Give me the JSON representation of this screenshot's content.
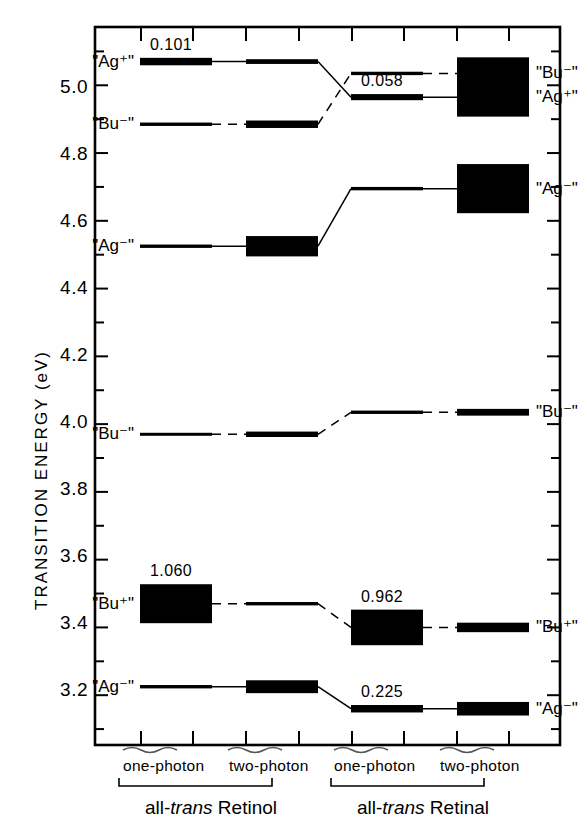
{
  "figure": {
    "y_axis_title": "TRANSITION ENERGY (eV)",
    "y_ticks_major": [
      "5.0",
      "4.8",
      "4.6",
      "4.4",
      "4.2",
      "4.0",
      "3.8",
      "3.6",
      "3.4",
      "3.2"
    ],
    "column_labels": [
      "one-photon",
      "two-photon",
      "one-photon",
      "two-photon"
    ],
    "group_labels": [
      "all-",
      "trans",
      " Retinol",
      "all-",
      "trans",
      " Retinal"
    ],
    "group_left": {
      "prefix": "all-",
      "italic": "trans",
      "suffix": " Retinol"
    },
    "group_right": {
      "prefix": "all-",
      "italic": "trans",
      "suffix": " Retinal"
    }
  },
  "chart_data": {
    "type": "line",
    "xlabel": "",
    "ylabel": "TRANSITION ENERGY (eV)",
    "ylim": [
      3.05,
      5.17
    ],
    "yticks": [
      3.2,
      3.4,
      3.6,
      3.8,
      4.0,
      4.2,
      4.4,
      4.6,
      4.8,
      5.0
    ],
    "grid": false,
    "legend": "none",
    "columns": [
      {
        "id": "retinol-one-photon",
        "label": "one-photon",
        "molecule": "all-trans Retinol"
      },
      {
        "id": "retinol-two-photon",
        "label": "two-photon",
        "molecule": "all-trans Retinol"
      },
      {
        "id": "retinal-one-photon",
        "label": "one-photon",
        "molecule": "all-trans Retinal"
      },
      {
        "id": "retinal-two-photon",
        "label": "two-photon",
        "molecule": "all-trans Retinal"
      }
    ],
    "levels": [
      {
        "state": "\"Ag+\"",
        "left_label": "\"Ag⁺\"",
        "right_label": null,
        "connector": "solid",
        "energies": [
          5.07,
          5.07,
          4.965,
          4.965
        ],
        "oscillator_strengths": [
          {
            "column": "retinol-one-photon",
            "value": "0.101"
          },
          {
            "column": "retinal-one-photon",
            "value": "0.058"
          }
        ],
        "box_heights_eV": [
          0.022,
          0.014,
          0.018,
          0.115
        ],
        "right_state": "\"Ag+\""
      },
      {
        "state": "\"Bu-\"",
        "left_label": "\"Bu⁻\"",
        "connector": "dashed",
        "energies": [
          4.885,
          4.885,
          5.035,
          5.035
        ],
        "oscillator_strengths": [],
        "box_heights_eV": [
          0.01,
          0.022,
          0.01,
          0.095
        ],
        "right_state": "\"Bu-\""
      },
      {
        "state": "\"Ag-\"",
        "left_label": "\"Ag⁻\"",
        "connector": "solid",
        "energies": [
          4.525,
          4.525,
          4.695,
          4.695
        ],
        "oscillator_strengths": [],
        "box_heights_eV": [
          0.01,
          0.06,
          0.01,
          0.145
        ],
        "right_state": "\"Ag-\""
      },
      {
        "state": "\"Bu-\"",
        "left_label": "\"Bu⁻\"",
        "connector": "dashed",
        "energies": [
          3.97,
          3.97,
          4.035,
          4.035
        ],
        "oscillator_strengths": [],
        "box_heights_eV": [
          0.008,
          0.016,
          0.01,
          0.02
        ],
        "right_state": "\"Bu-\""
      },
      {
        "state": "\"Bu+\"",
        "left_label": "\"Bu⁺\"",
        "connector": "dashed",
        "energies": [
          3.47,
          3.47,
          3.4,
          3.4
        ],
        "oscillator_strengths": [
          {
            "column": "retinol-one-photon",
            "value": "1.060"
          },
          {
            "column": "retinal-one-photon",
            "value": "0.962"
          }
        ],
        "box_heights_eV": [
          0.115,
          0.01,
          0.105,
          0.028
        ],
        "right_state": "\"Bu+\""
      },
      {
        "state": "\"Ag-\"",
        "left_label": "\"Ag⁻\"",
        "connector": "solid",
        "energies": [
          3.225,
          3.225,
          3.16,
          3.16
        ],
        "oscillator_strengths": [
          {
            "column": "retinal-one-photon",
            "value": "0.225"
          }
        ],
        "box_heights_eV": [
          0.01,
          0.038,
          0.022,
          0.04
        ],
        "right_state": "\"Ag-\""
      }
    ]
  }
}
